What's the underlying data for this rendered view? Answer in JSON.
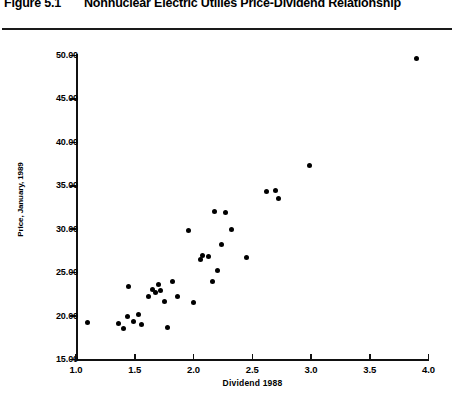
{
  "figure": {
    "number": "Figure 5.1",
    "title": "Nonnuclear Electric Utilies Price-Dividend Relationship"
  },
  "chart_data": {
    "type": "scatter",
    "title": "Nonnuclear Electric Utilies Price-Dividend Relationship",
    "xlabel": "Dividend  1988",
    "ylabel": "Price, January, 1989",
    "xlim": [
      1.0,
      4.0
    ],
    "ylim": [
      15.0,
      50.0
    ],
    "grid": false,
    "legend": "none",
    "xticks": [
      "1.0",
      "1.5",
      "2.0",
      "2.5",
      "3.0",
      "3.5",
      "4.0"
    ],
    "xtick_values": [
      1.0,
      1.5,
      2.0,
      2.5,
      3.0,
      3.5,
      4.0
    ],
    "yticks": [
      "15.00",
      "20.00",
      "25.00",
      "30.00",
      "35.00",
      "40.00",
      "45.00",
      "50.00"
    ],
    "ytick_values": [
      15.0,
      20.0,
      25.0,
      30.0,
      35.0,
      40.0,
      45.0,
      50.0
    ],
    "points": [
      {
        "x": 1.1,
        "y": 19.3
      },
      {
        "x": 1.36,
        "y": 19.2
      },
      {
        "x": 1.4,
        "y": 18.6
      },
      {
        "x": 1.44,
        "y": 19.9
      },
      {
        "x": 1.45,
        "y": 23.4
      },
      {
        "x": 1.49,
        "y": 19.4
      },
      {
        "x": 1.53,
        "y": 20.2
      },
      {
        "x": 1.56,
        "y": 19.0
      },
      {
        "x": 1.62,
        "y": 22.3
      },
      {
        "x": 1.65,
        "y": 23.1
      },
      {
        "x": 1.68,
        "y": 22.7
      },
      {
        "x": 1.7,
        "y": 23.6
      },
      {
        "x": 1.72,
        "y": 22.9
      },
      {
        "x": 1.75,
        "y": 21.7
      },
      {
        "x": 1.78,
        "y": 18.7
      },
      {
        "x": 1.82,
        "y": 24.0
      },
      {
        "x": 1.86,
        "y": 22.2
      },
      {
        "x": 1.96,
        "y": 29.8
      },
      {
        "x": 2.0,
        "y": 21.6
      },
      {
        "x": 2.06,
        "y": 26.5
      },
      {
        "x": 2.08,
        "y": 27.0
      },
      {
        "x": 2.13,
        "y": 26.9
      },
      {
        "x": 2.16,
        "y": 24.0
      },
      {
        "x": 2.18,
        "y": 32.0
      },
      {
        "x": 2.2,
        "y": 25.2
      },
      {
        "x": 2.24,
        "y": 28.2
      },
      {
        "x": 2.27,
        "y": 31.9
      },
      {
        "x": 2.32,
        "y": 30.0
      },
      {
        "x": 2.45,
        "y": 26.8
      },
      {
        "x": 2.62,
        "y": 34.3
      },
      {
        "x": 2.7,
        "y": 34.5
      },
      {
        "x": 2.72,
        "y": 33.5
      },
      {
        "x": 2.99,
        "y": 37.3
      },
      {
        "x": 3.9,
        "y": 49.6
      }
    ]
  }
}
